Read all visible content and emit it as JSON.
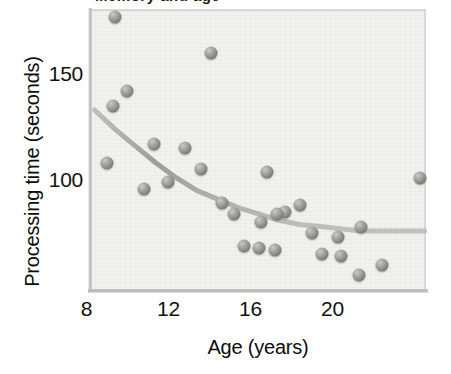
{
  "figure": {
    "title_partial": "Memory and age",
    "background_color": "#f1f1ef",
    "point_color": "#8b8b87",
    "curve_color": "#9d9d99"
  },
  "axes": {
    "x": {
      "label": "Age (years)",
      "ticks": [
        "8",
        "12",
        "16",
        "20"
      ],
      "tick_values": [
        8,
        12,
        16,
        20
      ],
      "range": [
        7.8,
        24.1
      ]
    },
    "y": {
      "label": "Processing time (seconds)",
      "ticks": [
        "150",
        "100"
      ],
      "tick_values": [
        150,
        100
      ],
      "range": [
        48,
        183
      ]
    }
  },
  "chart_data": {
    "type": "scatter",
    "title": "Memory and age",
    "xlabel": "Age (years)",
    "ylabel": "Processing time (seconds)",
    "xlim": [
      7.8,
      24.1
    ],
    "ylim": [
      48,
      183
    ],
    "xticks": [
      8,
      12,
      16,
      20
    ],
    "yticks": [
      100,
      150
    ],
    "grid": false,
    "legend": null,
    "marker_style": "3d-sphere-gray",
    "series": [
      {
        "name": "Observations",
        "points": [
          {
            "x": 9.0,
            "y": 177
          },
          {
            "x": 13.7,
            "y": 160
          },
          {
            "x": 9.6,
            "y": 142
          },
          {
            "x": 8.9,
            "y": 135
          },
          {
            "x": 10.9,
            "y": 117
          },
          {
            "x": 12.4,
            "y": 115
          },
          {
            "x": 8.6,
            "y": 108
          },
          {
            "x": 13.2,
            "y": 105
          },
          {
            "x": 16.4,
            "y": 104
          },
          {
            "x": 23.9,
            "y": 101
          },
          {
            "x": 11.6,
            "y": 99
          },
          {
            "x": 10.4,
            "y": 96
          },
          {
            "x": 14.2,
            "y": 89
          },
          {
            "x": 18.0,
            "y": 88
          },
          {
            "x": 17.3,
            "y": 85
          },
          {
            "x": 14.8,
            "y": 84
          },
          {
            "x": 16.9,
            "y": 84
          },
          {
            "x": 16.1,
            "y": 80
          },
          {
            "x": 21.0,
            "y": 78
          },
          {
            "x": 18.6,
            "y": 75
          },
          {
            "x": 19.9,
            "y": 73
          },
          {
            "x": 15.3,
            "y": 69
          },
          {
            "x": 16.0,
            "y": 68
          },
          {
            "x": 16.8,
            "y": 67
          },
          {
            "x": 19.1,
            "y": 65
          },
          {
            "x": 20.0,
            "y": 64
          },
          {
            "x": 22.0,
            "y": 60
          },
          {
            "x": 20.9,
            "y": 55
          }
        ]
      }
    ],
    "fit_curve": {
      "name": "Exponential decay fit",
      "description": "Smooth decreasing curve levelling off near 76 seconds",
      "points": [
        {
          "x": 8.0,
          "y": 133
        },
        {
          "x": 9.0,
          "y": 124
        },
        {
          "x": 10.0,
          "y": 116
        },
        {
          "x": 11.0,
          "y": 108
        },
        {
          "x": 12.0,
          "y": 101
        },
        {
          "x": 13.0,
          "y": 95
        },
        {
          "x": 14.0,
          "y": 91
        },
        {
          "x": 15.0,
          "y": 87
        },
        {
          "x": 16.0,
          "y": 84
        },
        {
          "x": 17.0,
          "y": 81
        },
        {
          "x": 18.0,
          "y": 79
        },
        {
          "x": 19.0,
          "y": 78
        },
        {
          "x": 20.0,
          "y": 77
        },
        {
          "x": 21.0,
          "y": 76
        },
        {
          "x": 22.0,
          "y": 76
        },
        {
          "x": 23.0,
          "y": 76
        },
        {
          "x": 24.1,
          "y": 76
        }
      ]
    }
  }
}
